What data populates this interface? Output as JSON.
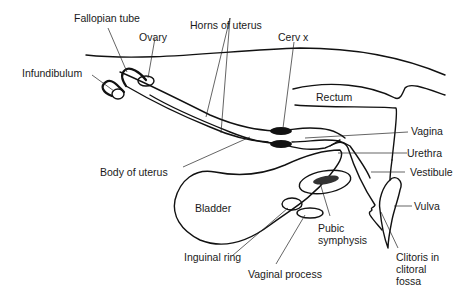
{
  "diagram": {
    "type": "anatomical-sagittal-section",
    "colors": {
      "line": "#111111",
      "text": "#1a1a1a",
      "background": "#ffffff"
    },
    "labels": {
      "fallopian_tube": "Fallopian tube",
      "ovary": "Ovary",
      "horns_of_uterus": "Horns of uterus",
      "cervix": "Cerv x",
      "infundibulum": "Infundibulum",
      "rectum": "Rectum",
      "vagina": "Vagina",
      "body_of_uterus": "Body of uterus",
      "urethra": "Urethra",
      "vestibule": "Vestibule",
      "bladder": "Bladder",
      "vulva": "Vulva",
      "pubic_symphysis": "Pubic\nsymphysis",
      "inguinal_ring": "Inguinal ring",
      "clitoris": "Clitoris in\nclitoral\nfossa",
      "vaginal_process": "Vaginal process"
    }
  }
}
